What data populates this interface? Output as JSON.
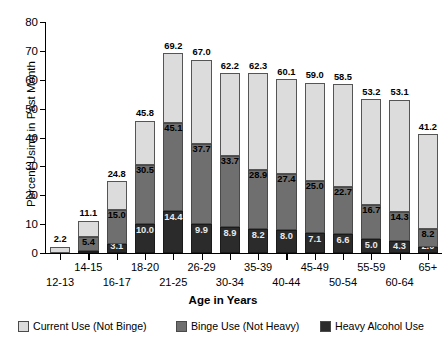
{
  "chart_data": {
    "type": "bar",
    "subtype": "stacked-vertical",
    "title": "",
    "xlabel": "Age in Years",
    "ylabel": "Percent Using in Past Month",
    "ylim": [
      0,
      80
    ],
    "yticks": [
      0,
      10,
      20,
      30,
      40,
      50,
      60,
      70,
      80
    ],
    "grid": false,
    "legend_position": "bottom",
    "categories": [
      "12-13",
      "14-15",
      "16-17",
      "18-20",
      "21-25",
      "26-29",
      "30-34",
      "35-39",
      "40-44",
      "45-49",
      "50-54",
      "55-59",
      "60-64",
      "65+"
    ],
    "series": [
      {
        "name": "Current Use (Not Binge)",
        "color": "#dcdcdc",
        "values": [
          2.2,
          5.7,
          9.8,
          15.3,
          24.1,
          29.3,
          28.5,
          33.4,
          32.7,
          34.0,
          35.8,
          36.5,
          38.8,
          33.0
        ]
      },
      {
        "name": "Binge Use (Not Heavy)",
        "color": "#6f6f6f",
        "values": [
          0.0,
          4.8,
          11.9,
          20.5,
          30.7,
          27.8,
          24.8,
          20.7,
          19.4,
          17.9,
          16.1,
          11.7,
          10.0,
          6.2
        ]
      },
      {
        "name": "Heavy Alcohol Use",
        "color": "#2b2b2b",
        "values": [
          0.0,
          0.6,
          3.1,
          10.0,
          14.4,
          9.9,
          8.9,
          8.2,
          8.0,
          7.1,
          6.6,
          5.0,
          4.3,
          2.0
        ]
      }
    ],
    "cumulative_totals": [
      2.2,
      11.1,
      24.8,
      45.8,
      69.2,
      67.0,
      62.2,
      62.3,
      60.1,
      59.0,
      58.5,
      53.2,
      53.1,
      41.2
    ],
    "cumulative_binge_top": [
      null,
      5.4,
      15.0,
      30.5,
      45.1,
      37.7,
      33.7,
      28.9,
      27.4,
      25.0,
      22.7,
      16.7,
      14.3,
      8.2
    ],
    "heavy_labels": [
      null,
      "0.6",
      "3.1",
      "10.0",
      "14.4",
      "9.9",
      "8.9",
      "8.2",
      "8.0",
      "7.1",
      "6.6",
      "5.0",
      "4.3",
      "2.0"
    ],
    "total_labels": [
      "2.2",
      "11.1",
      "24.8",
      "45.8",
      "69.2",
      "67.0",
      "62.2",
      "62.3",
      "60.1",
      "59.0",
      "58.5",
      "53.2",
      "53.1",
      "41.2"
    ],
    "binge_labels": [
      null,
      "5.4",
      "15.0",
      "30.5",
      "45.1",
      "37.7",
      "33.7",
      "28.9",
      "27.4",
      "25.0",
      "22.7",
      "16.7",
      "14.3",
      "8.2"
    ]
  },
  "legend": {
    "items": [
      {
        "label": "Current Use (Not Binge)",
        "color": "#dcdcdc"
      },
      {
        "label": "Binge Use (Not Heavy)",
        "color": "#6f6f6f"
      },
      {
        "label": "Heavy Alcohol Use",
        "color": "#2b2b2b"
      }
    ]
  },
  "axes": {
    "y_title": "Percent Using in Past Month",
    "x_title": "Age in Years",
    "y_tick_labels": [
      "0",
      "10",
      "20",
      "30",
      "40",
      "50",
      "60",
      "70",
      "80"
    ],
    "x_tick_labels": [
      "12-13",
      "14-15",
      "16-17",
      "18-20",
      "21-25",
      "26-29",
      "30-34",
      "35-39",
      "40-44",
      "45-49",
      "50-54",
      "55-59",
      "60-64",
      "65+"
    ]
  }
}
